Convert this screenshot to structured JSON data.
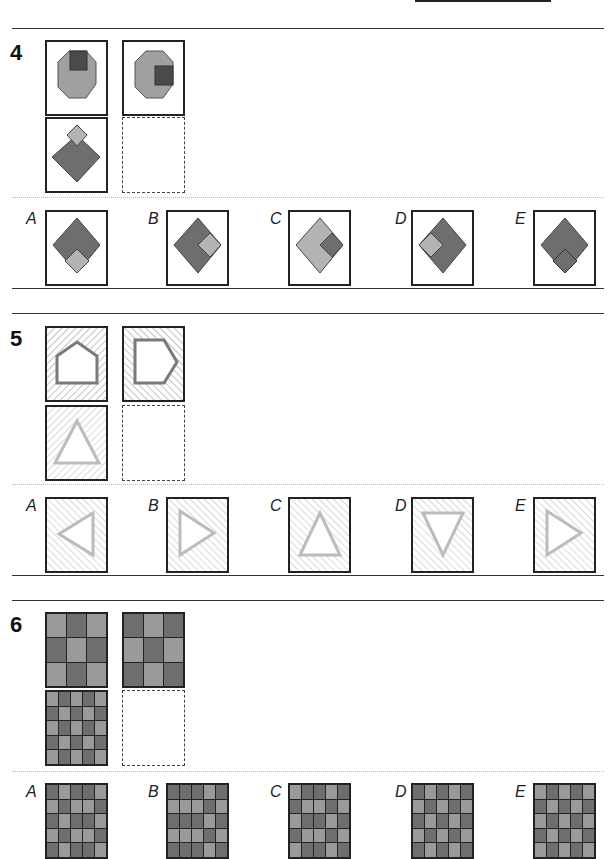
{
  "questions": [
    {
      "number": "4",
      "matrix": [
        "octagon-square-top",
        "octagon-square-right",
        "diamond-square-top",
        "blank"
      ],
      "options": [
        {
          "label": "A",
          "figure": "diamond-light-bottom"
        },
        {
          "label": "B",
          "figure": "diamond-light-right"
        },
        {
          "label": "C",
          "figure": "diamond-light-body-dark-right"
        },
        {
          "label": "D",
          "figure": "diamond-light-left"
        },
        {
          "label": "E",
          "figure": "diamond-dark-bottom-outlined"
        }
      ]
    },
    {
      "number": "5",
      "matrix": [
        "pentagon-up-hatch-right",
        "pentagon-right-hatch-left",
        "triangle-up-hatch-right",
        "blank"
      ],
      "options": [
        {
          "label": "A",
          "figure": "triangle-left"
        },
        {
          "label": "B",
          "figure": "triangle-right"
        },
        {
          "label": "C",
          "figure": "triangle-up"
        },
        {
          "label": "D",
          "figure": "triangle-down"
        },
        {
          "label": "E",
          "figure": "triangle-right"
        }
      ]
    },
    {
      "number": "6",
      "matrix": [
        "grid-3x3-LDL",
        "grid-3x3-DLD",
        "grid-5x5-checker",
        "blank"
      ],
      "options": [
        {
          "label": "A"
        },
        {
          "label": "B"
        },
        {
          "label": "C"
        },
        {
          "label": "D"
        },
        {
          "label": "E"
        }
      ]
    }
  ],
  "colors": {
    "light_gray": "#b4b4b4",
    "mid_gray": "#9a9a9a",
    "dark_gray": "#6e6e6e",
    "darker": "#4a4a4a",
    "hatch_light": "#c8c8c8",
    "hatch_dark": "#8a8a8a"
  },
  "grids": {
    "q6_top_left": [
      [
        "L",
        "D",
        "L"
      ],
      [
        "D",
        "L",
        "D"
      ],
      [
        "L",
        "D",
        "L"
      ]
    ],
    "q6_top_right": [
      [
        "D",
        "L",
        "D"
      ],
      [
        "L",
        "D",
        "L"
      ],
      [
        "D",
        "L",
        "D"
      ]
    ],
    "q6_bottom_left": [
      [
        "L",
        "D",
        "L",
        "D",
        "L"
      ],
      [
        "D",
        "L",
        "D",
        "L",
        "D"
      ],
      [
        "L",
        "D",
        "L",
        "D",
        "L"
      ],
      [
        "D",
        "L",
        "D",
        "L",
        "D"
      ],
      [
        "L",
        "D",
        "L",
        "D",
        "L"
      ]
    ],
    "q6_options_visible_rows": {
      "A": [
        [
          "D",
          "L",
          "D",
          "D",
          "L"
        ],
        [
          "L",
          "D",
          "L",
          "L",
          "D"
        ]
      ],
      "B": [
        [
          "D",
          "D",
          "D",
          "L",
          "D"
        ],
        [
          "L",
          "L",
          "L",
          "D",
          "L"
        ]
      ],
      "C": [
        [
          "L",
          "D",
          "D",
          "L",
          "D"
        ],
        [
          "D",
          "L",
          "L",
          "D",
          "L"
        ]
      ],
      "D": [
        [
          "D",
          "L",
          "D",
          "L",
          "D"
        ],
        [
          "L",
          "D",
          "L",
          "D",
          "L"
        ]
      ],
      "E": [
        [
          "L",
          "D",
          "L",
          "D",
          "L"
        ],
        [
          "D",
          "L",
          "D",
          "L",
          "D"
        ]
      ]
    }
  }
}
